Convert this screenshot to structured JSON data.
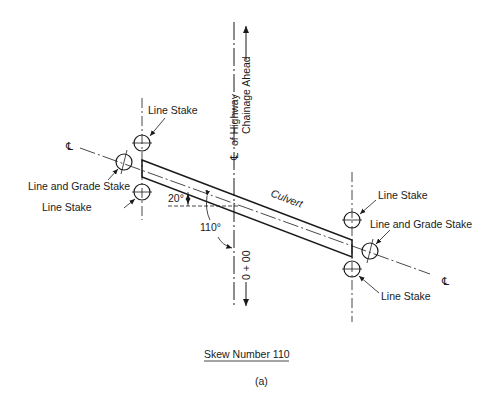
{
  "diagram": {
    "highway_label": "of Highway",
    "chainage_label": "Chainage Ahead",
    "station_label": "0 + 00",
    "culvert_label": "Culvert",
    "angle_small": "20°",
    "angle_large": "110°",
    "centerline_symbol": "℄",
    "left": {
      "upper_stake": "Line Stake",
      "grade_stake": "Line and Grade Stake",
      "lower_stake": "Line Stake"
    },
    "right": {
      "upper_stake": "Line Stake",
      "grade_stake": "Line and Grade Stake",
      "lower_stake": "Line Stake"
    },
    "caption": "Skew Number 110",
    "subcaption": "(a)"
  }
}
